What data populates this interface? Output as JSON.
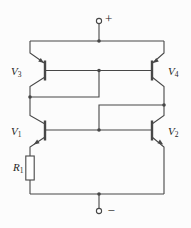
{
  "terminals": {
    "positive_label": "+",
    "negative_label": "−"
  },
  "components": {
    "v1": {
      "name": "V",
      "sub": "1",
      "type": "npn-transistor"
    },
    "v2": {
      "name": "V",
      "sub": "2",
      "type": "npn-transistor"
    },
    "v3": {
      "name": "V",
      "sub": "3",
      "type": "pnp-transistor"
    },
    "v4": {
      "name": "V",
      "sub": "4",
      "type": "pnp-transistor"
    },
    "r1": {
      "name": "R",
      "sub": "1",
      "type": "resistor"
    }
  },
  "colors": {
    "line": "#474747",
    "text": "#1f1f1f",
    "background": "#fcfcfc"
  }
}
